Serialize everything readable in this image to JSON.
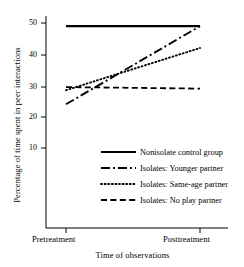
{
  "chart_data": {
    "type": "line",
    "title": "",
    "xlabel": "Time of observations",
    "ylabel": "Percentage of time spent in peer interactions",
    "categories": [
      "Pretreatment",
      "Posttreatment"
    ],
    "x": [
      0,
      1
    ],
    "ylim": [
      0,
      52
    ],
    "yticks": [
      10,
      20,
      30,
      40,
      50
    ],
    "ytick_labels": [
      "10",
      "20",
      "30",
      "40",
      "50"
    ],
    "grid": false,
    "legend_position": "inside lower-right",
    "series": [
      {
        "name": "Nonisolate control group",
        "style": "solid",
        "color": "#000000",
        "values": [
          49,
          49
        ]
      },
      {
        "name": "Isolates: Younger partner",
        "style": "dash-dot",
        "color": "#000000",
        "values": [
          24,
          49
        ]
      },
      {
        "name": "Isolates: Same-age partner",
        "style": "dotted",
        "color": "#000000",
        "values": [
          28.5,
          42
        ]
      },
      {
        "name": "Isolates: No play partner",
        "style": "dashed",
        "color": "#000000",
        "values": [
          29.5,
          29
        ]
      }
    ]
  },
  "axes": {
    "y_title": "Percentage of time spent in peer interactions",
    "x_title": "Time of observations",
    "y_ticks": [
      {
        "label": "50"
      },
      {
        "label": "40"
      },
      {
        "label": "30"
      },
      {
        "label": "20"
      },
      {
        "label": "10"
      }
    ],
    "x_ticks": [
      {
        "label": "Pretreatment"
      },
      {
        "label": "Posttreatment"
      }
    ]
  },
  "legend": {
    "entries": [
      {
        "label": "Nonisolate control group",
        "style": "solid"
      },
      {
        "label": "Isolates: Younger partner",
        "style": "dash-dot"
      },
      {
        "label": "Isolates: Same-age partner",
        "style": "dotted"
      },
      {
        "label": "Isolates: No play partner",
        "style": "dashed"
      }
    ]
  }
}
